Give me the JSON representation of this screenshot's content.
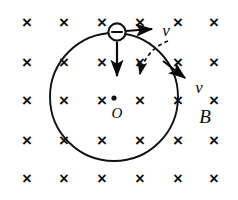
{
  "figure": {
    "canvas": {
      "width": 238,
      "height": 200,
      "background": "#ffffff"
    },
    "ink_color": "#111111"
  },
  "field": {
    "symbol": "×",
    "meaning": "magnetic-field-into-page",
    "label": "B",
    "label_position": {
      "x": 205,
      "y": 115
    },
    "rows_y": [
      22,
      62,
      100,
      140,
      178
    ],
    "cols_x": [
      27,
      64,
      102,
      140,
      178,
      214
    ],
    "glyph_size": 17
  },
  "orbit": {
    "center": {
      "x": 114,
      "y": 97
    },
    "radius": 64,
    "center_label": "O",
    "center_label_position": {
      "x": 117,
      "y": 113
    },
    "stroke_width": 1.9
  },
  "particle": {
    "sign": "−",
    "charge": "negative",
    "position": {
      "x": 117,
      "y": 32
    },
    "radius": 9
  },
  "vectors": [
    {
      "name": "velocity-top",
      "label": "v",
      "from": {
        "x": 126,
        "y": 31
      },
      "to": {
        "x": 156,
        "y": 29
      },
      "label_position": {
        "x": 166,
        "y": 30
      },
      "style": "solid"
    },
    {
      "name": "centripetal-down",
      "label": "",
      "from": {
        "x": 117,
        "y": 42
      },
      "to": {
        "x": 117,
        "y": 80
      },
      "label_position": null,
      "style": "solid"
    },
    {
      "name": "velocity-lower-right",
      "label": "v",
      "from": {
        "x": 163,
        "y": 61
      },
      "to": {
        "x": 188,
        "y": 80
      },
      "label_position": {
        "x": 199,
        "y": 87
      },
      "style": "solid"
    }
  ],
  "angle_indicator": {
    "name": "sweep-arc",
    "style": "dashed",
    "from": {
      "x": 168,
      "y": 41
    },
    "to": {
      "x": 136,
      "y": 76
    },
    "arrow_direction": "down-left"
  },
  "labels": {
    "velocity": "v",
    "field": "B",
    "center": "O",
    "charge_sign": "−"
  }
}
